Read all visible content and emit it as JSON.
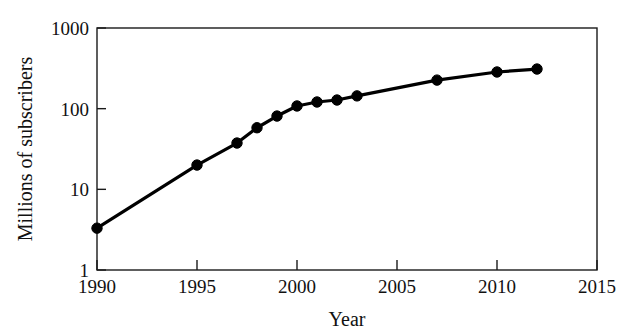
{
  "chart_data": {
    "type": "line",
    "title": "",
    "subtitle": "",
    "xlabel": "Year",
    "ylabel": "Millions of subscribers",
    "xlim": [
      1990,
      2015
    ],
    "ylim": [
      1,
      1000
    ],
    "yscale": "log",
    "xscale": "linear",
    "grid": false,
    "legend": null,
    "legend_position": "none",
    "marker": "filled-circle",
    "line_color": "#000000",
    "marker_color": "#000000",
    "background_color": "#ffffff",
    "frame_color": "#1a1a1a",
    "x": [
      1990,
      1995,
      1997,
      1998,
      1999,
      2000,
      2001,
      2002,
      2003,
      2007,
      2010,
      2012
    ],
    "values": [
      3.3,
      20,
      37.5,
      58,
      81,
      108,
      121,
      128,
      144,
      226,
      285,
      310
    ],
    "series": [
      {
        "name": "Millions of subscribers",
        "x": [
          1990,
          1995,
          1997,
          1998,
          1999,
          2000,
          2001,
          2002,
          2003,
          2007,
          2010,
          2012
        ],
        "values": [
          3.3,
          20,
          37.5,
          58,
          81,
          108,
          121,
          128,
          144,
          226,
          285,
          310
        ]
      }
    ],
    "xticks": [
      1990,
      1995,
      2000,
      2005,
      2010,
      2015
    ],
    "xtick_labels": [
      "1990",
      "1995",
      "2000",
      "2005",
      "2010",
      "2015"
    ],
    "yticks": [
      1,
      10,
      100,
      1000
    ],
    "ytick_labels": [
      "1",
      "10",
      "100",
      "1000"
    ],
    "annotations": []
  },
  "axes": {
    "x_title": "Year",
    "y_title": "Millions of subscribers"
  }
}
